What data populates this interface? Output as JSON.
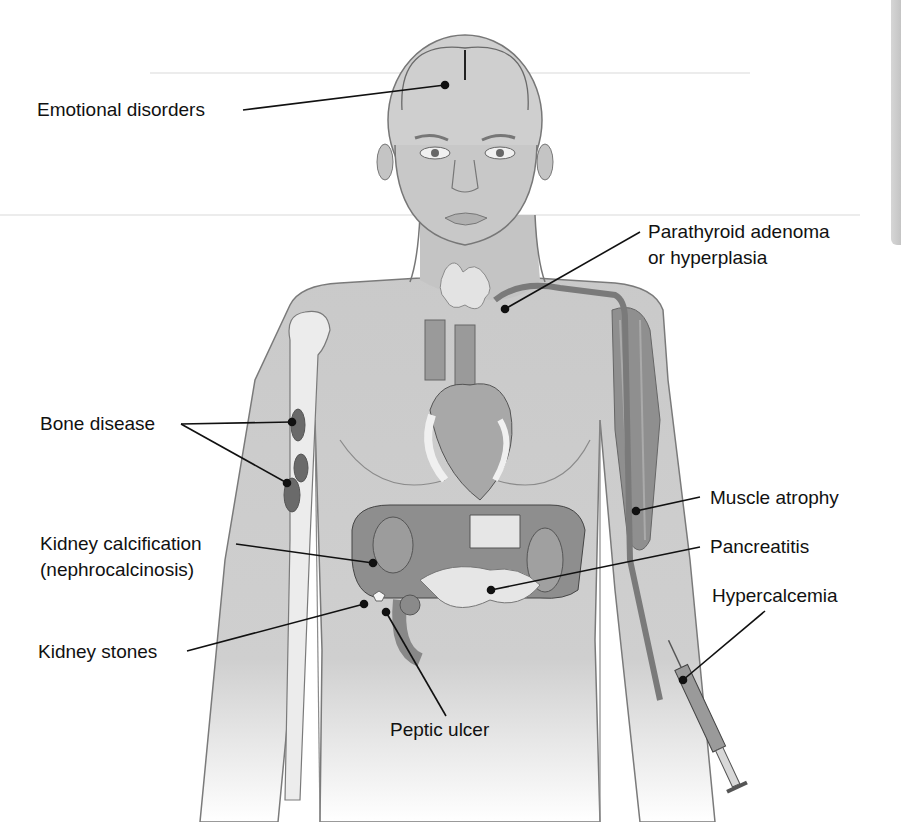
{
  "figure": {
    "type": "labeled anatomical illustration",
    "colors": {
      "skin": "#c9c9c9",
      "outline": "#6e6e6e",
      "bone": "#ececec",
      "organ_dark": "#8a8a8a",
      "organ_mid": "#a8a8a8",
      "organ_light": "#e2e2e2",
      "leader_line": "#111111",
      "label_text": "#111111"
    }
  },
  "labels": {
    "emotional_disorders": "Emotional disorders",
    "parathyroid_line1": "Parathyroid adenoma",
    "parathyroid_line2": "or hyperplasia",
    "bone_disease": "Bone disease",
    "muscle_atrophy": "Muscle atrophy",
    "kidney_calc_line1": "Kidney calcification",
    "kidney_calc_line2": "(nephrocalcinosis)",
    "pancreatitis": "Pancreatitis",
    "hypercalcemia": "Hypercalcemia",
    "kidney_stones": "Kidney stones",
    "peptic_ulcer": "Peptic ulcer"
  }
}
